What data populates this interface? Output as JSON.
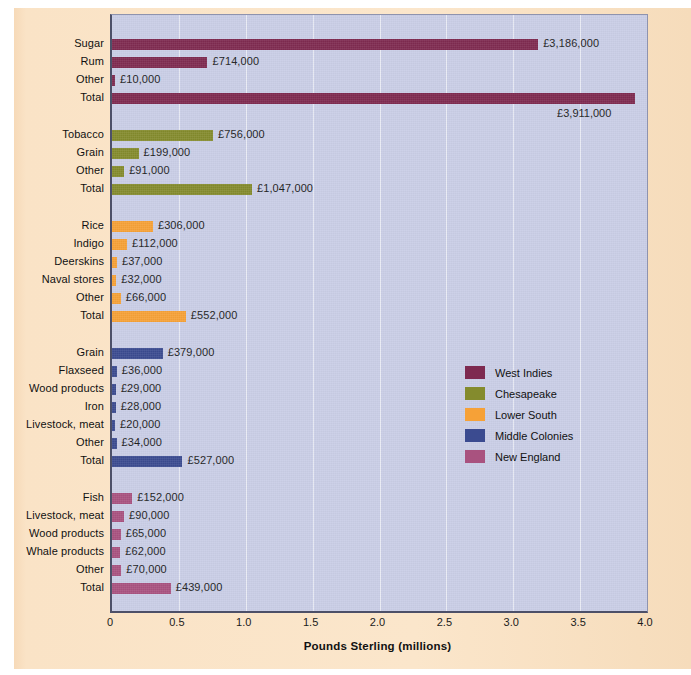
{
  "chart_data": {
    "type": "bar",
    "orientation": "horizontal",
    "title": "",
    "xlabel": "Pounds Sterling (millions)",
    "ylabel": "",
    "xlim": [
      0,
      4.0
    ],
    "xticks": [
      "0",
      "0.5",
      "1.0",
      "1.5",
      "2.0",
      "2.5",
      "3.0",
      "3.5",
      "4.0"
    ],
    "xtick_values": [
      0,
      0.5,
      1.0,
      1.5,
      2.0,
      2.5,
      3.0,
      3.5,
      4.0
    ],
    "grid": "vertical",
    "legend_position": "center-right",
    "units": "pounds sterling",
    "value_scale": "millions",
    "plot_background": "#c9cde6",
    "page_background": "#f9e2c5",
    "groups": [
      {
        "name": "West Indies",
        "color": "#7e2a50",
        "rows": [
          {
            "label": "Sugar",
            "value": 3.186,
            "value_label": "£3,186,000",
            "label_placement": "right"
          },
          {
            "label": "Rum",
            "value": 0.714,
            "value_label": "£714,000",
            "label_placement": "right"
          },
          {
            "label": "Other",
            "value": 0.01,
            "value_label": "£10,000",
            "label_placement": "right"
          },
          {
            "label": "Total",
            "value": 3.911,
            "value_label": "£3,911,000",
            "label_placement": "below-right"
          }
        ]
      },
      {
        "name": "Chesapeake",
        "color": "#848b2d",
        "rows": [
          {
            "label": "Tobacco",
            "value": 0.756,
            "value_label": "£756,000",
            "label_placement": "right"
          },
          {
            "label": "Grain",
            "value": 0.199,
            "value_label": "£199,000",
            "label_placement": "right"
          },
          {
            "label": "Other",
            "value": 0.091,
            "value_label": "£91,000",
            "label_placement": "right"
          },
          {
            "label": "Total",
            "value": 1.047,
            "value_label": "£1,047,000",
            "label_placement": "right"
          }
        ]
      },
      {
        "name": "Lower South",
        "color": "#f6a137",
        "rows": [
          {
            "label": "Rice",
            "value": 0.306,
            "value_label": "£306,000",
            "label_placement": "right"
          },
          {
            "label": "Indigo",
            "value": 0.112,
            "value_label": "£112,000",
            "label_placement": "right"
          },
          {
            "label": "Deerskins",
            "value": 0.037,
            "value_label": "£37,000",
            "label_placement": "right"
          },
          {
            "label": "Naval stores",
            "value": 0.032,
            "value_label": "£32,000",
            "label_placement": "right"
          },
          {
            "label": "Other",
            "value": 0.066,
            "value_label": "£66,000",
            "label_placement": "right"
          },
          {
            "label": "Total",
            "value": 0.552,
            "value_label": "£552,000",
            "label_placement": "right"
          }
        ]
      },
      {
        "name": "Middle Colonies",
        "color": "#3b4b90",
        "rows": [
          {
            "label": "Grain",
            "value": 0.379,
            "value_label": "£379,000",
            "label_placement": "right"
          },
          {
            "label": "Flaxseed",
            "value": 0.036,
            "value_label": "£36,000",
            "label_placement": "right"
          },
          {
            "label": "Wood products",
            "value": 0.029,
            "value_label": "£29,000",
            "label_placement": "right"
          },
          {
            "label": "Iron",
            "value": 0.028,
            "value_label": "£28,000",
            "label_placement": "right"
          },
          {
            "label": "Livestock, meat",
            "value": 0.02,
            "value_label": "£20,000",
            "label_placement": "right"
          },
          {
            "label": "Other",
            "value": 0.034,
            "value_label": "£34,000",
            "label_placement": "right"
          },
          {
            "label": "Total",
            "value": 0.527,
            "value_label": "£527,000",
            "label_placement": "right"
          }
        ]
      },
      {
        "name": "New England",
        "color": "#a9527f",
        "rows": [
          {
            "label": "Fish",
            "value": 0.152,
            "value_label": "£152,000",
            "label_placement": "right"
          },
          {
            "label": "Livestock, meat",
            "value": 0.09,
            "value_label": "£90,000",
            "label_placement": "right"
          },
          {
            "label": "Wood products",
            "value": 0.065,
            "value_label": "£65,000",
            "label_placement": "right"
          },
          {
            "label": "Whale products",
            "value": 0.062,
            "value_label": "£62,000",
            "label_placement": "right"
          },
          {
            "label": "Other",
            "value": 0.07,
            "value_label": "£70,000",
            "label_placement": "right"
          },
          {
            "label": "Total",
            "value": 0.439,
            "value_label": "£439,000",
            "label_placement": "right"
          }
        ]
      }
    ],
    "legend": [
      {
        "label": "West Indies",
        "color": "#7e2a50"
      },
      {
        "label": "Chesapeake",
        "color": "#848b2d"
      },
      {
        "label": "Lower South",
        "color": "#f6a137"
      },
      {
        "label": "Middle Colonies",
        "color": "#3b4b90"
      },
      {
        "label": "New England",
        "color": "#a9527f"
      }
    ]
  }
}
